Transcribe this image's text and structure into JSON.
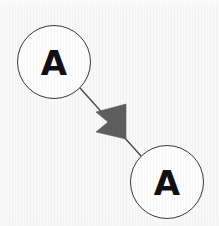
{
  "diagram": {
    "type": "node-link-graph",
    "width": 219,
    "height": 226,
    "background_color": "#f8f8f8",
    "title": "",
    "nodes": [
      {
        "id": "node-a-top",
        "label": "A",
        "shape": "circle",
        "cx": 54,
        "cy": 62,
        "r": 36.5,
        "fill": "#fdfdfd",
        "stroke": "#3a3a3a",
        "stroke_width": 1,
        "label_color": "#111111",
        "label_font_size": 34
      },
      {
        "id": "node-a-bottom",
        "label": "A",
        "shape": "circle",
        "cx": 167,
        "cy": 182,
        "r": 36.5,
        "fill": "#fdfdfd",
        "stroke": "#3a3a3a",
        "stroke_width": 1,
        "label_color": "#111111",
        "label_font_size": 34
      }
    ],
    "edges": [
      {
        "id": "edge-a-to-a",
        "from": "node-a-top",
        "to": "node-a-bottom",
        "label": "",
        "stroke": "#4a4a4a",
        "stroke_width": 1.4,
        "x1": 80,
        "y1": 88,
        "x2": 141,
        "y2": 156,
        "arrowhead": {
          "style": "filled-triangle",
          "position": "midpoint",
          "fill": "#5e5e5e",
          "tip_x": 126,
          "tip_y": 122,
          "points": "126,104 126,139 96,132 108,122 96,112"
        }
      }
    ]
  }
}
